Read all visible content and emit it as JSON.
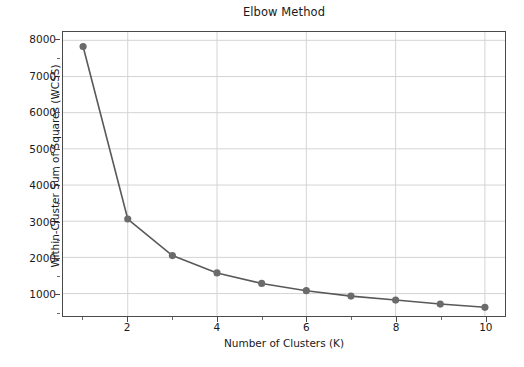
{
  "chart_data": {
    "type": "line",
    "title": "Elbow Method",
    "xlabel": "Number of Clusters (K)",
    "ylabel": "Within-Cluster Sum of Squares (WCSS)",
    "x": [
      1,
      2,
      3,
      4,
      5,
      6,
      7,
      8,
      9,
      10
    ],
    "values": [
      7830,
      3060,
      2050,
      1570,
      1280,
      1080,
      930,
      820,
      710,
      620
    ],
    "series": [
      {
        "name": "WCSS",
        "values": [
          7830,
          3060,
          2050,
          1570,
          1280,
          1080,
          930,
          820,
          710,
          620
        ]
      }
    ],
    "xlim": [
      0.55,
      10.45
    ],
    "ylim": [
      380,
      8230
    ],
    "xticks": [
      2,
      4,
      6,
      8,
      10
    ],
    "xtick_labels": [
      "2",
      "4",
      "6",
      "8",
      "10"
    ],
    "xticks_minor": [
      1,
      3,
      5,
      7,
      9
    ],
    "yticks": [
      1000,
      2000,
      3000,
      4000,
      5000,
      6000,
      7000,
      8000
    ],
    "ytick_labels": [
      "1000",
      "2000",
      "3000",
      "4000",
      "5000",
      "6000",
      "7000",
      "8000"
    ],
    "grid": true,
    "legend": "none",
    "marker": "circle",
    "line_color": "#595959",
    "marker_color": "#6b6b6b",
    "grid_color": "#d4d4d4",
    "axes_color": "#4a4a4a",
    "background_color": "#ffffff"
  }
}
